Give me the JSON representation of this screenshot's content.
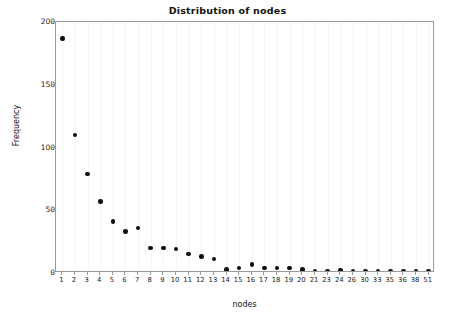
{
  "chart_data": {
    "type": "scatter",
    "title": "Distribution of nodes",
    "xlabel": "nodes",
    "ylabel": "Frequency",
    "categories": [
      "1",
      "2",
      "3",
      "4",
      "5",
      "6",
      "7",
      "8",
      "9",
      "10",
      "11",
      "12",
      "13",
      "14",
      "15",
      "16",
      "17",
      "18",
      "19",
      "20",
      "21",
      "23",
      "24",
      "26",
      "30",
      "33",
      "35",
      "36",
      "38",
      "51"
    ],
    "values": [
      187,
      110,
      79,
      57,
      41,
      33,
      36,
      20,
      20,
      19,
      15,
      13,
      11,
      3,
      4,
      7,
      4,
      4,
      4,
      3,
      1,
      1,
      2,
      1,
      1,
      1,
      1,
      1,
      1,
      1
    ],
    "ylim": [
      0,
      200
    ],
    "yticks": [
      0,
      50,
      100,
      150,
      200
    ],
    "ytick_labels": [
      "0",
      "50",
      "100",
      "150",
      "200"
    ],
    "grid": "vertical-only",
    "legend": null,
    "marker": {
      "shape": "circle",
      "color": "#0d0d0d",
      "size": 4.6
    },
    "axis_color": "#9a9a9a",
    "grid_color": "#f4f4f4",
    "background": "#ffffff"
  }
}
